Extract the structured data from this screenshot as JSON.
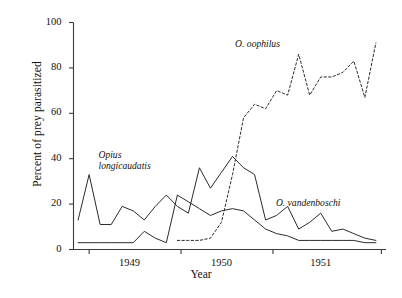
{
  "chart_data": {
    "type": "line",
    "title": "",
    "xlabel": "Year",
    "ylabel": "Percent of prey parasitized",
    "xlim": [
      1948.45,
      1951.85
    ],
    "ylim": [
      0,
      100
    ],
    "grid": false,
    "legend_position": "inline-annotations",
    "y_ticks": [
      0,
      20,
      40,
      60,
      80,
      100
    ],
    "y_tick_labels": [
      "0",
      "20",
      "40",
      "60",
      "80",
      "100"
    ],
    "x_tick_labels": [
      "1949",
      "1950",
      "1951"
    ],
    "x_tick_positions": [
      1949.0,
      1950.0,
      1951.0
    ],
    "x_boundary_ticks": [
      1948.62,
      1949.62,
      1950.62,
      1951.8
    ],
    "series": [
      {
        "name": "Opius longicaudatis",
        "style": "solid",
        "color": "#2b2b2b",
        "x": [
          1948.5,
          1948.62,
          1948.74,
          1948.86,
          1948.98,
          1949.1,
          1949.22,
          1949.34,
          1949.46,
          1949.58,
          1949.7,
          1949.82,
          1949.94,
          1950.06,
          1950.18,
          1950.3,
          1950.42,
          1950.54,
          1950.66,
          1950.78,
          1950.9,
          1951.02,
          1951.14,
          1951.26,
          1951.38,
          1951.5,
          1951.62,
          1951.74
        ],
        "y": [
          13,
          33,
          11,
          11,
          19,
          17,
          13,
          19,
          24,
          19,
          16,
          36,
          27,
          34,
          41,
          36,
          33,
          13,
          15,
          19,
          9,
          12,
          16,
          8,
          9,
          7,
          5,
          4
        ]
      },
      {
        "name": "O. vandenboschi",
        "style": "solid",
        "color": "#2b2b2b",
        "x": [
          1948.5,
          1948.62,
          1948.74,
          1948.86,
          1948.98,
          1949.1,
          1949.22,
          1949.34,
          1949.46,
          1949.58,
          1949.7,
          1949.82,
          1949.94,
          1950.06,
          1950.18,
          1950.3,
          1950.42,
          1950.54,
          1950.66,
          1950.78,
          1950.9,
          1951.02,
          1951.14,
          1951.26,
          1951.38,
          1951.5,
          1951.62,
          1951.74
        ],
        "y": [
          3,
          3,
          3,
          3,
          3,
          3,
          8,
          5,
          3,
          24,
          21,
          18,
          15,
          17,
          18,
          17,
          13,
          9,
          7,
          6,
          4,
          4,
          4,
          4,
          4,
          4,
          3,
          3
        ]
      },
      {
        "name": "O. oophilus",
        "style": "dashed",
        "color": "#2b2b2b",
        "x": [
          1949.58,
          1949.7,
          1949.82,
          1949.94,
          1950.06,
          1950.18,
          1950.3,
          1950.42,
          1950.54,
          1950.66,
          1950.78,
          1950.9,
          1951.02,
          1951.14,
          1951.26,
          1951.38,
          1951.5,
          1951.62,
          1951.74
        ],
        "y": [
          4,
          4,
          4,
          5,
          12,
          33,
          58,
          64,
          62,
          70,
          68,
          86,
          68,
          76,
          76,
          78,
          83,
          67,
          91
        ]
      }
    ],
    "annotations": [
      {
        "text": "Opius\nlongicaudatis",
        "x": 1948.7,
        "y": 42,
        "style": "italic"
      },
      {
        "text": "O. oophilus",
        "x": 1950.6,
        "y": 90,
        "style": "italic"
      },
      {
        "text": "O. vandenboschi",
        "x": 1951.0,
        "y": 20,
        "style": "italic"
      }
    ]
  },
  "labels": {
    "ylabel": "Percent of prey parasitized",
    "xlabel": "Year",
    "y0": "0",
    "y20": "20",
    "y40": "40",
    "y60": "60",
    "y80": "80",
    "y100": "100",
    "x1949": "1949",
    "x1950": "1950",
    "x1951": "1951",
    "ann_opius_line1": "Opius",
    "ann_opius_line2": "longicaudatis",
    "ann_oophilus": "O. oophilus",
    "ann_vandenboschi": "O. vandenboschi"
  }
}
